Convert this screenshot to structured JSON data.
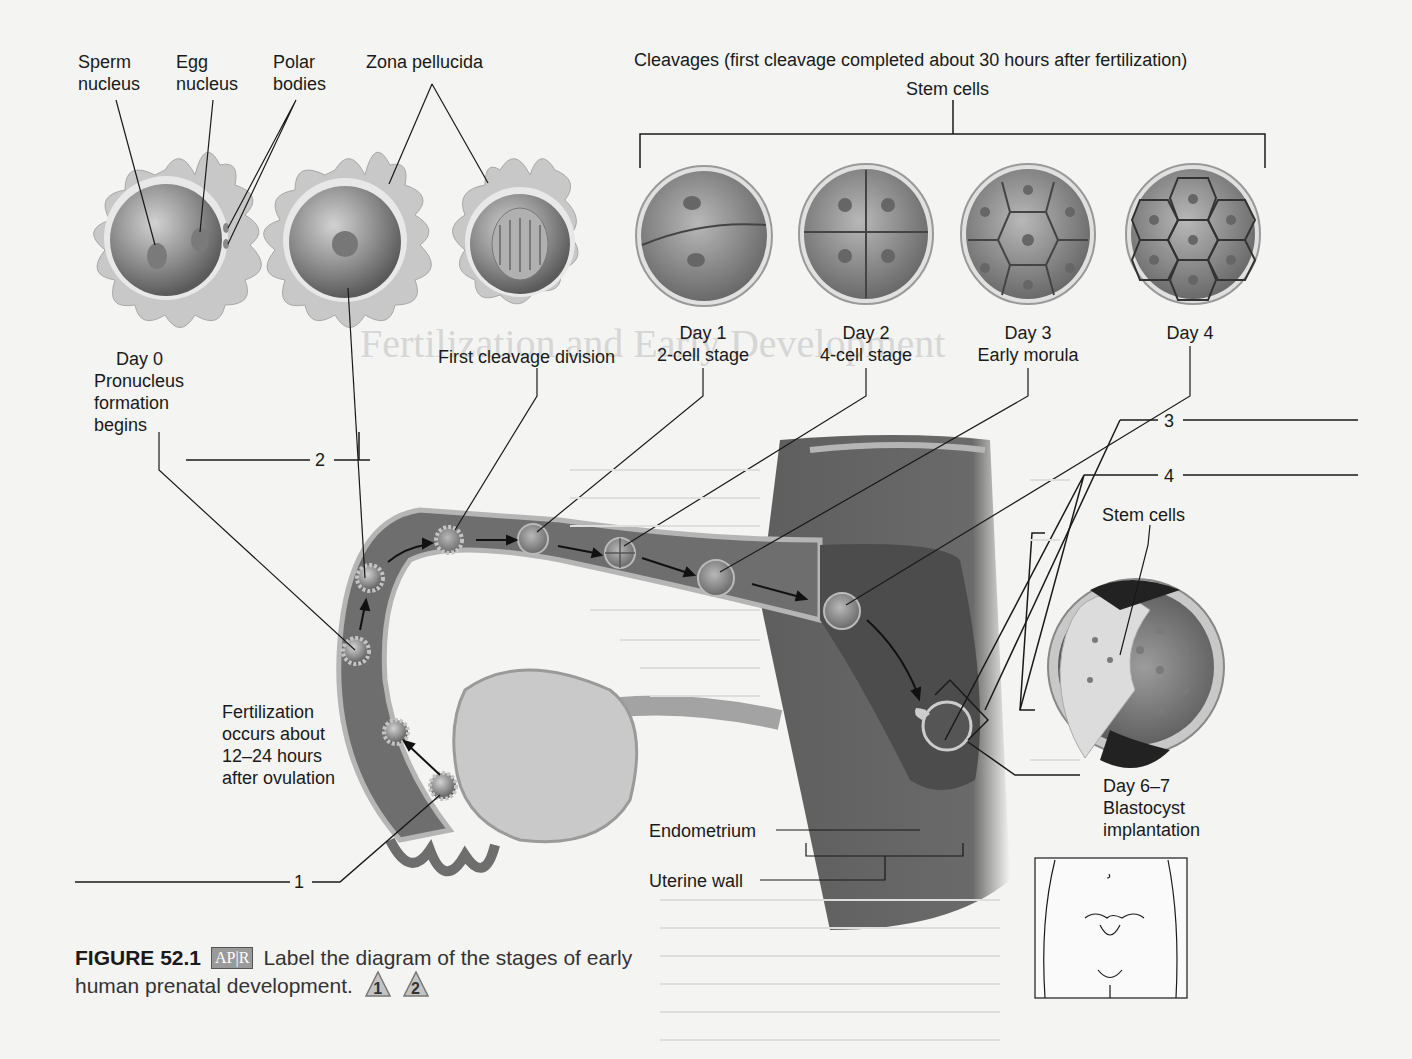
{
  "figure": {
    "number": "FIGURE 52.1",
    "badge": "AP|R",
    "caption_line1": "Label the diagram of the stages of early",
    "caption_line2": "human prenatal development.",
    "markers": [
      "1",
      "2"
    ]
  },
  "top_labels": {
    "sperm_nucleus": [
      "Sperm",
      "nucleus"
    ],
    "egg_nucleus": [
      "Egg",
      "nucleus"
    ],
    "polar_bodies": [
      "Polar",
      "bodies"
    ],
    "zona_pellucida": "Zona pellucida",
    "cleavages": "Cleavages (first cleavage completed about 30 hours after fertilization)",
    "stem_cells_top": "Stem cells"
  },
  "stages": [
    {
      "lines": [
        "Day 0",
        "Pronucleus",
        "formation",
        "begins"
      ]
    },
    {
      "lines": [
        "First cleavage division"
      ]
    },
    {
      "lines": [
        "Day 1",
        "2-cell stage"
      ]
    },
    {
      "lines": [
        "Day 2",
        "4-cell stage"
      ]
    },
    {
      "lines": [
        "Day 3",
        "Early morula"
      ]
    },
    {
      "lines": [
        "Day 4"
      ]
    }
  ],
  "fertilization_note": [
    "Fertilization",
    "occurs about",
    "12–24 hours",
    "after ovulation"
  ],
  "blastocyst": {
    "stem_cells_label": "Stem cells",
    "lines": [
      "Day 6–7",
      "Blastocyst",
      "implantation"
    ]
  },
  "structures": {
    "endometrium": "Endometrium",
    "uterine_wall": "Uterine wall"
  },
  "blanks": [
    "1",
    "2",
    "3",
    "4"
  ],
  "colors": {
    "background": "#f4f4f2",
    "tube": "#6e6e6e",
    "tube_edge": "#b5b5b5",
    "cell_fill": "#8a8a8a",
    "corona": "#c4c4c4",
    "ink": "#1a1a1a"
  }
}
